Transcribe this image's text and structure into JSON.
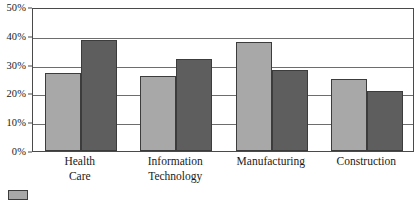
{
  "chart_data": {
    "type": "bar",
    "title": "",
    "subtitle": "",
    "xlabel": "",
    "ylabel": "",
    "grid": true,
    "legend_position": "bottom-left",
    "ylim": [
      0,
      50
    ],
    "ytick_labels": [
      "50%",
      "40%",
      "30%",
      "20%",
      "10%",
      "0%"
    ],
    "ytick_values": [
      50,
      40,
      30,
      20,
      10,
      0
    ],
    "categories": [
      "Health\nCare",
      "Information\nTechnology",
      "Manufacturing",
      "Construction"
    ],
    "series": [
      {
        "name": "",
        "color": "#a8a8a8",
        "values": [
          27,
          26,
          38,
          25
        ]
      },
      {
        "name": "",
        "color": "#5e5e5e",
        "values": [
          38.5,
          32,
          28,
          21
        ]
      }
    ]
  },
  "legend": {
    "items": [
      {
        "label": "",
        "color": "#a8a8a8"
      }
    ]
  },
  "colors": {
    "series_a": "#a8a8a8",
    "series_b": "#5e5e5e",
    "frame": "#4a4a4a",
    "gridline": "#6d6d6d",
    "bar_outline": "#3c3c3c",
    "background": "#ffffff",
    "text": "#1a1a1a"
  }
}
